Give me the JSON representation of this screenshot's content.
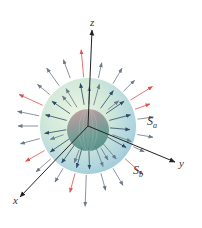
{
  "diagram": {
    "title": "",
    "axes": {
      "z": {
        "label": "z",
        "x1": 88,
        "y1": 126,
        "x2": 92,
        "y2": 30,
        "label_x": 90,
        "label_y": 26
      },
      "y": {
        "label": "y",
        "x1": 88,
        "y1": 126,
        "x2": 175,
        "y2": 162,
        "label_x": 179,
        "label_y": 167
      },
      "x": {
        "label": "x",
        "x1": 88,
        "y1": 126,
        "x2": 20,
        "y2": 197,
        "label_x": 13,
        "label_y": 204
      }
    },
    "surfaces": {
      "outer": {
        "name": "S",
        "subscript": "a",
        "cx": 88,
        "cy": 126,
        "r": 48,
        "label_x": 147,
        "label_y": 125
      },
      "inner": {
        "name": "S",
        "subscript": "b",
        "cx": 88,
        "cy": 130,
        "r": 21,
        "label_x": 133,
        "label_y": 174
      }
    },
    "colors": {
      "axis": "#222222",
      "field_arrow": "#6b7a8a",
      "field_arrow_dark": "#2f4a66",
      "field_arrow_red": "#d9544a",
      "outer_sphere_light": "#dcefd9",
      "outer_sphere_mid": "#b7dbe0",
      "outer_sphere_dark": "#8fc3d6",
      "inner_sphere_top": "#b98a94",
      "inner_sphere_bottom": "#4f8c86"
    }
  }
}
